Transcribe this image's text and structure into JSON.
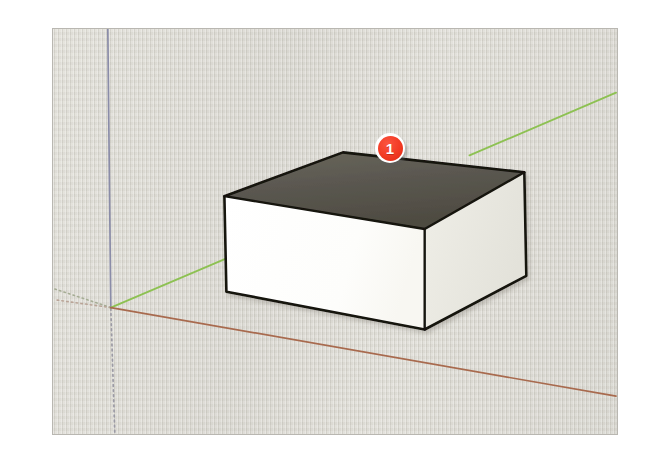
{
  "app": {
    "name": "SketchUp",
    "view_label": "3D modeling viewport",
    "background_color": "#d6d4cd",
    "border_color": "#b9b7b1"
  },
  "viewport": {
    "x": 52,
    "y": 28,
    "width": 566,
    "height": 407
  },
  "axes": {
    "origin": {
      "x": 110,
      "y": 308
    },
    "items": [
      {
        "name": "blue-axis",
        "label": "Blue axis (Z, vertical)",
        "color": "#8a8ca8",
        "style": "solid",
        "from": {
          "x": 107,
          "y": 28
        },
        "to": {
          "x": 110,
          "y": 308
        }
      },
      {
        "name": "blue-axis-negative",
        "label": "Blue axis negative (Z, below ground)",
        "color": "#9a9aa6",
        "style": "dotted",
        "from": {
          "x": 110,
          "y": 308
        },
        "to": {
          "x": 114,
          "y": 434
        }
      },
      {
        "name": "green-axis",
        "label": "Green axis (Y)",
        "color": "#8dc152",
        "style": "solid",
        "from": {
          "x": 110,
          "y": 308
        },
        "to": {
          "x": 617,
          "y": 92
        }
      },
      {
        "name": "green-axis-negative",
        "label": "Green axis negative (Y)",
        "color": "#a9b598",
        "style": "dotted",
        "from": {
          "x": 110,
          "y": 308
        },
        "to": {
          "x": 53,
          "y": 290
        }
      },
      {
        "name": "red-axis",
        "label": "Red axis (X)",
        "color": "#a86a4e",
        "style": "solid",
        "from": {
          "x": 110,
          "y": 308
        },
        "to": {
          "x": 617,
          "y": 397
        }
      },
      {
        "name": "red-axis-negative",
        "label": "Red axis negative (X)",
        "color": "#b8a396",
        "style": "dotted",
        "from": {
          "x": 110,
          "y": 308
        },
        "to": {
          "x": 53,
          "y": 299
        }
      }
    ]
  },
  "model": {
    "name": "rectangular-box",
    "description": "Extruded rectangle forming a low rectangular box on the ground plane",
    "faces": {
      "top": {
        "name": "top-face",
        "fill": "#595649",
        "points": "224,196 343,152 525,172 425,229"
      },
      "front_left": {
        "name": "front-left-face",
        "fill": "#fdfdfb",
        "points": "224,196 425,229 425,330 226,292"
      },
      "front_right": {
        "name": "front-right-face",
        "fill": "#f0efe9",
        "points": "425,229 525,172 527,276 425,330"
      }
    },
    "edge_color": "#14120e",
    "edge_width": 2.4
  },
  "callouts": [
    {
      "name": "callout-badge-1",
      "number": "1",
      "x": 322,
      "y": 104,
      "diameter": 30,
      "fill": "#f23a23",
      "ring": "#ffffff",
      "text_color": "#ffffff"
    }
  ]
}
